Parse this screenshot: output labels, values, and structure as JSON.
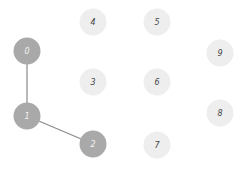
{
  "graph": {
    "nodes": [
      {
        "id": "0",
        "label": "0",
        "state": "visited"
      },
      {
        "id": "1",
        "label": "1",
        "state": "visited"
      },
      {
        "id": "2",
        "label": "2",
        "state": "visited"
      },
      {
        "id": "3",
        "label": "3",
        "state": "unvisited"
      },
      {
        "id": "4",
        "label": "4",
        "state": "unvisited"
      },
      {
        "id": "5",
        "label": "5",
        "state": "unvisited"
      },
      {
        "id": "6",
        "label": "6",
        "state": "unvisited"
      },
      {
        "id": "7",
        "label": "7",
        "state": "unvisited"
      },
      {
        "id": "8",
        "label": "8",
        "state": "unvisited"
      },
      {
        "id": "9",
        "label": "9",
        "state": "unvisited"
      }
    ],
    "edges": [
      {
        "from": "0",
        "to": "1"
      },
      {
        "from": "1",
        "to": "2"
      }
    ],
    "colors": {
      "visited": "#a9a9a9",
      "unvisited": "#eeeeee",
      "edge": "#8a8a8a"
    }
  }
}
